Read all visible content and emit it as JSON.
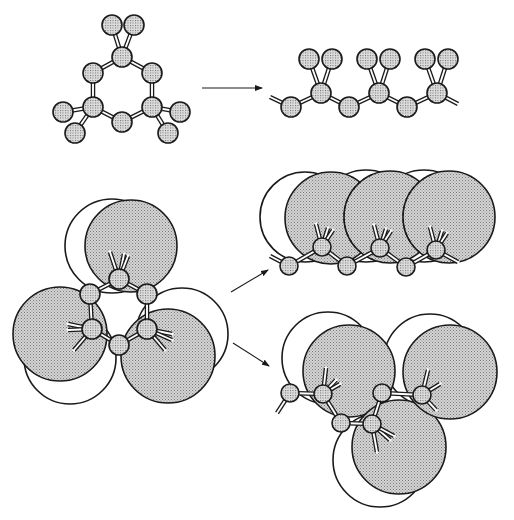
{
  "figure": {
    "description": "Conformations of a 1,1,3,3,5,5-hexamethyl cyclic trisilane-like ring versus an open-chain segment: ball-and-stick (top) and space-filling methyl volumes (bottom)",
    "colors": {
      "ink": "#1a1a1a",
      "atom_fill": "#c8c8c8",
      "volume_fill": "#bdbdbd",
      "background": "#ffffff"
    }
  },
  "panels": [
    {
      "id": "ring-ball-stick",
      "atoms": [
        [
          112,
          25
        ],
        [
          134,
          25
        ],
        [
          122,
          57
        ],
        [
          93,
          73
        ],
        [
          152,
          73
        ],
        [
          93,
          107
        ],
        [
          152,
          107
        ],
        [
          122,
          122
        ],
        [
          63,
          112
        ],
        [
          75,
          133
        ],
        [
          180,
          112
        ],
        [
          168,
          133
        ]
      ],
      "atom_r": 10,
      "bonds": [
        [
          122,
          57,
          93,
          73
        ],
        [
          122,
          57,
          152,
          73
        ],
        [
          93,
          73,
          93,
          107
        ],
        [
          152,
          73,
          152,
          107
        ],
        [
          93,
          107,
          122,
          122
        ],
        [
          152,
          107,
          122,
          122
        ],
        [
          122,
          57,
          112,
          25
        ],
        [
          122,
          57,
          134,
          25
        ],
        [
          93,
          107,
          63,
          112
        ],
        [
          93,
          107,
          75,
          133
        ],
        [
          152,
          107,
          180,
          112
        ],
        [
          152,
          107,
          168,
          133
        ]
      ]
    },
    {
      "id": "chain-ball-stick",
      "atoms": [
        [
          309,
          59
        ],
        [
          332,
          59
        ],
        [
          321,
          93
        ],
        [
          367,
          59
        ],
        [
          390,
          59
        ],
        [
          379,
          93
        ],
        [
          425,
          59
        ],
        [
          448,
          59
        ],
        [
          437,
          93
        ],
        [
          291,
          107
        ],
        [
          349,
          107
        ],
        [
          407,
          107
        ]
      ],
      "atom_r": 10,
      "bonds": [
        [
          270,
          97,
          291,
          107
        ],
        [
          291,
          107,
          321,
          93
        ],
        [
          321,
          93,
          349,
          107
        ],
        [
          349,
          107,
          379,
          93
        ],
        [
          379,
          93,
          407,
          107
        ],
        [
          407,
          107,
          437,
          93
        ],
        [
          437,
          93,
          458,
          104
        ],
        [
          321,
          93,
          309,
          59
        ],
        [
          321,
          93,
          332,
          59
        ],
        [
          379,
          93,
          367,
          59
        ],
        [
          379,
          93,
          390,
          59
        ],
        [
          437,
          93,
          425,
          59
        ],
        [
          437,
          93,
          448,
          59
        ]
      ]
    },
    {
      "id": "ring-space-filling",
      "white_circles": [
        [
          112,
          246,
          47
        ],
        [
          70,
          358,
          46
        ],
        [
          182,
          334,
          46
        ]
      ],
      "gray_circles": [
        [
          131,
          246,
          46
        ],
        [
          60,
          334,
          47
        ],
        [
          168,
          356,
          47
        ]
      ],
      "atoms": [
        [
          119,
          279
        ],
        [
          90,
          294
        ],
        [
          147,
          294
        ],
        [
          92,
          329
        ],
        [
          147,
          329
        ],
        [
          119,
          345
        ]
      ],
      "atom_r": 10,
      "bonds": [
        [
          119,
          279,
          90,
          294
        ],
        [
          119,
          279,
          147,
          294
        ],
        [
          90,
          294,
          92,
          329
        ],
        [
          147,
          294,
          147,
          329
        ],
        [
          92,
          329,
          119,
          345
        ],
        [
          147,
          329,
          119,
          345
        ],
        [
          119,
          279,
          110,
          252
        ],
        [
          119,
          279,
          124,
          254
        ],
        [
          119,
          279,
          128,
          256
        ],
        [
          92,
          329,
          68,
          324
        ],
        [
          92,
          329,
          68,
          330
        ],
        [
          92,
          329,
          74,
          350
        ],
        [
          147,
          329,
          172,
          334
        ],
        [
          147,
          329,
          165,
          350
        ],
        [
          147,
          329,
          172,
          340
        ]
      ]
    },
    {
      "id": "chain-space-filling",
      "white_circles": [
        [
          305,
          217,
          45
        ],
        [
          366,
          216,
          46
        ],
        [
          424,
          216,
          46
        ]
      ],
      "gray_circles": [
        [
          331,
          218,
          46
        ],
        [
          390,
          217,
          46
        ],
        [
          449,
          217,
          46
        ]
      ],
      "dashed_arcs": [
        [
          390,
          217,
          46
        ],
        [
          449,
          217,
          46
        ]
      ],
      "atoms": [
        [
          322,
          247
        ],
        [
          380,
          248
        ],
        [
          436,
          250
        ],
        [
          289,
          266
        ],
        [
          347,
          266
        ],
        [
          406,
          267
        ]
      ],
      "atom_r": 9,
      "bonds": [
        [
          270,
          256,
          289,
          266
        ],
        [
          289,
          266,
          322,
          247
        ],
        [
          322,
          247,
          347,
          266
        ],
        [
          347,
          266,
          380,
          248
        ],
        [
          380,
          248,
          406,
          267
        ],
        [
          406,
          267,
          436,
          250
        ],
        [
          436,
          250,
          458,
          262
        ],
        [
          322,
          247,
          316,
          224
        ],
        [
          322,
          247,
          328,
          228
        ],
        [
          322,
          247,
          333,
          230
        ],
        [
          380,
          248,
          374,
          225
        ],
        [
          380,
          248,
          386,
          229
        ],
        [
          380,
          248,
          391,
          231
        ],
        [
          436,
          250,
          430,
          227
        ],
        [
          436,
          250,
          442,
          231
        ],
        [
          436,
          250,
          447,
          233
        ]
      ]
    },
    {
      "id": "helix-space-filling",
      "white_circles": [
        [
          328,
          358,
          46
        ],
        [
          380,
          460,
          47
        ],
        [
          430,
          360,
          46
        ]
      ],
      "gray_circles": [
        [
          349,
          371,
          46
        ],
        [
          399,
          447,
          47
        ],
        [
          450,
          372,
          47
        ]
      ],
      "atoms": [
        [
          290,
          393
        ],
        [
          323,
          394
        ],
        [
          341,
          423
        ],
        [
          372,
          424
        ],
        [
          382,
          393
        ],
        [
          422,
          395
        ]
      ],
      "atom_r": 9,
      "bonds": [
        [
          277,
          413,
          290,
          393
        ],
        [
          290,
          393,
          323,
          394
        ],
        [
          323,
          394,
          341,
          423
        ],
        [
          341,
          423,
          372,
          424
        ],
        [
          372,
          424,
          382,
          393
        ],
        [
          382,
          393,
          422,
          395
        ],
        [
          323,
          394,
          326,
          368
        ],
        [
          323,
          394,
          336,
          380
        ],
        [
          323,
          394,
          340,
          384
        ],
        [
          372,
          424,
          377,
          452
        ],
        [
          372,
          424,
          390,
          440
        ],
        [
          372,
          424,
          394,
          436
        ],
        [
          422,
          395,
          428,
          370
        ],
        [
          422,
          395,
          440,
          384
        ],
        [
          422,
          395,
          436,
          410
        ]
      ]
    }
  ],
  "arrows": [
    {
      "id": "arrow-top",
      "x1": 202,
      "y1": 88,
      "x2": 262,
      "y2": 88
    },
    {
      "id": "arrow-upper",
      "x1": 231,
      "y1": 292,
      "x2": 268,
      "y2": 270
    },
    {
      "id": "arrow-lower",
      "x1": 233,
      "y1": 343,
      "x2": 269,
      "y2": 366
    }
  ]
}
